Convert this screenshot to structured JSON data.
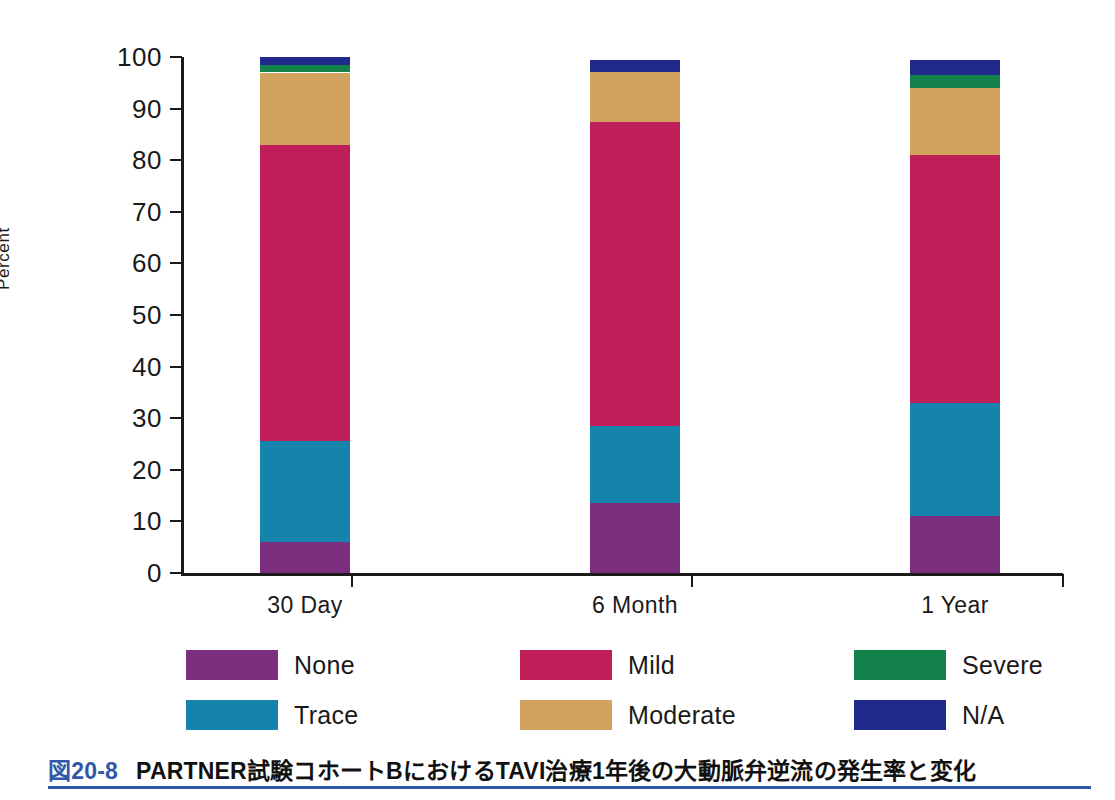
{
  "chart_data": {
    "type": "bar",
    "subtype": "stacked-bar-100-percent",
    "title": "",
    "xlabel": "",
    "ylabel": "Percent",
    "ylim": [
      0,
      100
    ],
    "yticks": [
      0,
      10,
      20,
      30,
      40,
      50,
      60,
      70,
      80,
      90,
      100
    ],
    "ytick_labels": [
      "0",
      "10",
      "20",
      "30",
      "40",
      "50",
      "60",
      "70",
      "80",
      "90",
      "100"
    ],
    "grid": false,
    "legend_position": "bottom",
    "categories": [
      "30 Day",
      "6 Month",
      "1 Year"
    ],
    "series": [
      {
        "name": "None",
        "color": "#7B2E7E",
        "values": [
          6.0,
          13.5,
          11.0
        ]
      },
      {
        "name": "Trace",
        "color": "#1683AD",
        "values": [
          19.5,
          15.0,
          22.0
        ]
      },
      {
        "name": "Mild",
        "color": "#C01E58",
        "values": [
          57.5,
          59.0,
          48.0
        ]
      },
      {
        "name": "Moderate",
        "color": "#D1A35E",
        "values": [
          14.0,
          9.5,
          13.0
        ]
      },
      {
        "name": "Severe",
        "color": "#12824A",
        "values": [
          1.5,
          0.0,
          2.5
        ]
      },
      {
        "name": "N/A",
        "color": "#1F2A8C",
        "values": [
          1.5,
          2.5,
          3.0
        ]
      }
    ],
    "cumulative_tops": {
      "30 Day": [
        6.0,
        25.5,
        83.0,
        97.0,
        98.5,
        100.0
      ],
      "6 Month": [
        13.5,
        28.5,
        87.5,
        97.0,
        97.0,
        99.5
      ],
      "1 Year": [
        11.0,
        33.0,
        81.0,
        94.0,
        96.5,
        99.5
      ]
    }
  },
  "axis": {
    "y_title": "Percent",
    "y_labels": [
      "100",
      "90",
      "80",
      "70",
      "60",
      "50",
      "40",
      "30",
      "20",
      "10",
      "0"
    ],
    "x_labels": [
      "30 Day",
      "6 Month",
      "1 Year"
    ]
  },
  "legend": {
    "items": [
      {
        "label": "None",
        "color": "#7B2E7E"
      },
      {
        "label": "Trace",
        "color": "#1683AD"
      },
      {
        "label": "Mild",
        "color": "#C01E58"
      },
      {
        "label": "Moderate",
        "color": "#D1A35E"
      },
      {
        "label": "Severe",
        "color": "#12824A"
      },
      {
        "label": "N/A",
        "color": "#1F2A8C"
      }
    ]
  },
  "caption": {
    "number": "図20-8",
    "text": "PARTNER試験コホートBにおけるTAVI治療1年後の大動脈弁逆流の発生率と変化",
    "accent_color": "#2f58a8"
  }
}
